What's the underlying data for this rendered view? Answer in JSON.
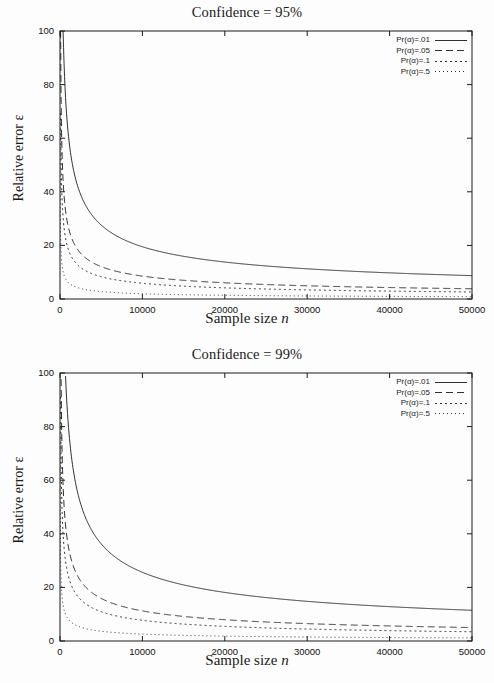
{
  "figure": {
    "panels": [
      {
        "title": "Confidence = 95%",
        "xlabel_pre": "Sample size ",
        "xlabel_var": "n",
        "ylabel": "Relative error ε"
      },
      {
        "title": "Confidence = 99%",
        "xlabel_pre": "Sample size ",
        "xlabel_var": "n",
        "ylabel": "Relative error ε"
      }
    ]
  },
  "legend": {
    "entries": [
      {
        "label": "Pr(α)=.01",
        "style": "solid"
      },
      {
        "label": "Pr(α)=.05",
        "style": "dashed"
      },
      {
        "label": "Pr(α)=.1",
        "style": "dotted"
      },
      {
        "label": "Pr(α)=.5",
        "style": "fine-dotted"
      }
    ]
  },
  "axes": {
    "x_ticks": [
      "0",
      "10000",
      "20000",
      "30000",
      "40000",
      "50000"
    ],
    "y_ticks": [
      "0",
      "20",
      "40",
      "60",
      "80",
      "100"
    ],
    "x_tick_values": [
      0,
      10000,
      20000,
      30000,
      40000,
      50000
    ],
    "y_tick_values": [
      0,
      20,
      40,
      60,
      80,
      100
    ]
  },
  "colors": {
    "background": "#fdfdfd",
    "axis": "#1a1a1a",
    "curve": "#1a1a1a",
    "text": "#111111"
  },
  "chart_data": [
    {
      "type": "line",
      "title": "Confidence = 95%",
      "xlabel": "Sample size n",
      "ylabel": "Relative error ε",
      "xlim": [
        0,
        50000
      ],
      "ylim": [
        0,
        100
      ],
      "grid": false,
      "legend_position": "top-right",
      "z": 1.96,
      "x": [
        200,
        500,
        1000,
        2000,
        3000,
        5000,
        7500,
        10000,
        15000,
        18600,
        20000,
        25000,
        30000,
        35000,
        40000,
        45000,
        50000
      ],
      "series": [
        {
          "name": "Pr(α)=.01",
          "p": 0.01,
          "style": "solid",
          "values": [
            137.1,
            86.7,
            61.3,
            43.4,
            35.4,
            27.4,
            22.4,
            19.4,
            15.8,
            14.2,
            13.7,
            12.3,
            11.2,
            10.4,
            9.7,
            9.1,
            8.7
          ],
          "values_plotted": [
            null,
            null,
            null,
            null,
            null,
            null,
            null,
            null,
            null,
            100.0,
            96.5,
            86.3,
            78.8,
            72.9,
            68.2,
            64.3,
            61.0
          ],
          "endpoint_at_50000": 61.0,
          "enters_top_at_x": 18600
        },
        {
          "name": "Pr(α)=.05",
          "p": 0.05,
          "style": "dashed",
          "values": [
            60.4,
            38.2,
            27.0,
            19.1,
            15.6,
            12.1,
            9.9,
            8.5,
            7.0,
            6.3,
            6.0,
            5.4,
            4.9,
            4.6,
            4.3,
            4.0,
            3.8
          ],
          "values_plotted": [
            100.0,
            85.4,
            60.4,
            42.7,
            34.9,
            27.0,
            22.1,
            19.1,
            15.6,
            14.0,
            13.5,
            12.1,
            11.0,
            10.2,
            9.6,
            9.0,
            8.5
          ],
          "endpoint_at_50000": 11.8,
          "enters_top_at_x": 1500
        },
        {
          "name": "Pr(α)=.1",
          "p": 0.1,
          "style": "dotted",
          "values": [
            41.6,
            26.3,
            18.6,
            13.2,
            10.7,
            8.3,
            6.8,
            5.9,
            4.8,
            4.3,
            4.2,
            3.7,
            3.4,
            3.1,
            2.9,
            2.8,
            2.6
          ],
          "endpoint_at_50000": 5.9,
          "enters_top_at_x": 700
        },
        {
          "name": "Pr(α)=.5",
          "p": 0.5,
          "style": "fine-dotted",
          "values": [
            13.9,
            8.8,
            6.2,
            4.4,
            3.6,
            2.8,
            2.3,
            2.0,
            1.6,
            1.4,
            1.4,
            1.2,
            1.1,
            1.0,
            1.0,
            0.9,
            0.9
          ],
          "endpoint_at_50000": 0.9,
          "enters_top_at_x": 80
        }
      ]
    },
    {
      "type": "line",
      "title": "Confidence = 99%",
      "xlabel": "Sample size n",
      "ylabel": "Relative error ε",
      "xlim": [
        0,
        50000
      ],
      "ylim": [
        0,
        100
      ],
      "grid": false,
      "legend_position": "top-right",
      "z": 2.576,
      "x": [
        200,
        500,
        1000,
        2000,
        3000,
        5000,
        7500,
        10000,
        15000,
        20000,
        26000,
        30000,
        35000,
        40000,
        45000,
        50000
      ],
      "series": [
        {
          "name": "Pr(α)=.01",
          "p": 0.01,
          "style": "solid",
          "endpoint_at_50000": 72.5,
          "enters_top_at_x": 26000,
          "values_plotted": [
            null,
            null,
            null,
            null,
            null,
            null,
            null,
            null,
            null,
            null,
            100.0,
            93.2,
            86.3,
            80.7,
            76.1,
            72.5
          ]
        },
        {
          "name": "Pr(α)=.05",
          "p": 0.05,
          "style": "dashed",
          "endpoint_at_50000": 14.0,
          "enters_top_at_x": 2600,
          "values_plotted": [
            100.0,
            100.0,
            100.0,
            100.0,
            45.9,
            35.5,
            29.0,
            25.1,
            20.5,
            17.8,
            15.6,
            14.5,
            13.4,
            12.6,
            11.8,
            11.2
          ]
        },
        {
          "name": "Pr(α)=.1",
          "p": 0.1,
          "style": "dotted",
          "endpoint_at_50000": 7.0,
          "enters_top_at_x": 1200
        },
        {
          "name": "Pr(α)=.5",
          "p": 0.5,
          "style": "fine-dotted",
          "endpoint_at_50000": 1.2,
          "enters_top_at_x": 130
        }
      ]
    }
  ]
}
